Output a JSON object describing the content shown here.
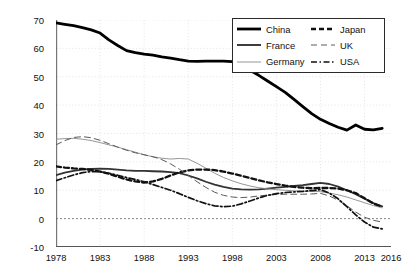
{
  "chart_data": {
    "type": "line",
    "title": "",
    "subtitle": "",
    "xlabel": "",
    "ylabel": "Value of net public wealth (% of national wealth)",
    "xlim": [
      1978,
      2016
    ],
    "ylim": [
      -10,
      70
    ],
    "yticks": [
      -10,
      0,
      10,
      20,
      30,
      40,
      50,
      60,
      70
    ],
    "xticks": [
      1978,
      1983,
      1988,
      1993,
      1998,
      2003,
      2008,
      2013,
      2016
    ],
    "xtick_labels": [
      "1978",
      "1983",
      "1988",
      "1993",
      "1998",
      "2003",
      "2008",
      "2013",
      "2016"
    ],
    "ytick_labels": [
      "-10",
      "0",
      "10",
      "20",
      "30",
      "40",
      "50",
      "60",
      "70"
    ],
    "grid": true,
    "legend_position": "top-right",
    "zero_line": 0,
    "x": [
      1978,
      1979,
      1980,
      1981,
      1982,
      1983,
      1984,
      1985,
      1986,
      1987,
      1988,
      1989,
      1990,
      1991,
      1992,
      1993,
      1994,
      1995,
      1996,
      1997,
      1998,
      1999,
      2000,
      2001,
      2002,
      2003,
      2004,
      2005,
      2006,
      2007,
      2008,
      2009,
      2010,
      2011,
      2012,
      2013,
      2014,
      2015
    ],
    "series": [
      {
        "name": "China",
        "style": "solid",
        "width": 2.8,
        "color": "#000000",
        "values": [
          69,
          68.5,
          68,
          67.3,
          66.5,
          65.4,
          63,
          61,
          59.2,
          58.5,
          58,
          57.6,
          57,
          56.6,
          56,
          55.5,
          55.4,
          55.5,
          55.5,
          55.5,
          55.3,
          54,
          52.3,
          50.5,
          48.5,
          46.5,
          44.5,
          42,
          39.5,
          37,
          35,
          33.5,
          32.2,
          31.2,
          33,
          31.5,
          31.3,
          31.8
        ]
      },
      {
        "name": "France",
        "style": "solid",
        "width": 1.8,
        "color": "#333333",
        "values": [
          15.3,
          16.2,
          16.8,
          17.3,
          17.5,
          17.6,
          17.5,
          17.3,
          17,
          16.8,
          16.8,
          16.7,
          16.6,
          16.4,
          16,
          15.2,
          14.2,
          13,
          12,
          11.2,
          10.6,
          10.3,
          10.2,
          10.3,
          10.6,
          10.9,
          11.2,
          11.5,
          11.8,
          12.2,
          12.6,
          12.2,
          11.3,
          10,
          8.6,
          7,
          5.5,
          4.3
        ]
      },
      {
        "name": "Germany",
        "style": "solid",
        "width": 0.9,
        "color": "#8a8a8a",
        "values": [
          28,
          28.2,
          28.3,
          28,
          27.5,
          26.8,
          26,
          25.2,
          24.3,
          23.4,
          22.5,
          21.8,
          21.3,
          21,
          21.2,
          21,
          19.5,
          17.8,
          16,
          14.5,
          13.3,
          12.3,
          11.5,
          10.9,
          10.5,
          10.2,
          10,
          9.8,
          9.7,
          9.6,
          9.5,
          9,
          8.4,
          7.6,
          6.6,
          5.6,
          4.6,
          3.8
        ]
      },
      {
        "name": "Japan",
        "style": "dashed-thick",
        "width": 2.3,
        "color": "#111111",
        "values": [
          18.4,
          18,
          17.7,
          17.5,
          17.2,
          16.6,
          15.8,
          14.8,
          13.8,
          13.1,
          12.7,
          13.1,
          14,
          15.2,
          16.3,
          17,
          17.3,
          17.3,
          17.1,
          16.6,
          15.9,
          15.1,
          14.3,
          13.5,
          12.8,
          12.2,
          11.6,
          11.2,
          10.9,
          10.7,
          10.8,
          10.8,
          10.6,
          10,
          9,
          7.2,
          5.3,
          4.2
        ]
      },
      {
        "name": "UK",
        "style": "dashed-thin",
        "width": 1.0,
        "color": "#5a5a5a",
        "values": [
          26,
          27.5,
          28.6,
          28.9,
          28.5,
          27.6,
          26.4,
          25.2,
          24.1,
          23.2,
          22.5,
          21.8,
          20.8,
          19.3,
          17.4,
          15.2,
          13,
          11,
          9.3,
          8.2,
          7.6,
          7.4,
          7.6,
          8,
          8.3,
          8.5,
          8.6,
          8.6,
          8.6,
          8.7,
          8.9,
          8,
          6.5,
          4.5,
          2.3,
          0.5,
          -0.6,
          -1.2
        ]
      },
      {
        "name": "USA",
        "style": "dash-dot",
        "width": 1.7,
        "color": "#111111",
        "values": [
          13.4,
          14.4,
          15.4,
          16.2,
          16.6,
          16.5,
          16,
          15.3,
          14.5,
          13.8,
          13,
          12,
          11,
          10,
          8.8,
          7.5,
          6.3,
          5.3,
          4.5,
          4.2,
          4.4,
          5.2,
          6.2,
          7.3,
          8.2,
          8.8,
          9.2,
          9.4,
          9.6,
          9.9,
          10.2,
          9,
          7,
          4.2,
          1.3,
          -1.2,
          -3,
          -3.6
        ]
      }
    ]
  },
  "legend": {
    "entries": [
      {
        "label": "China",
        "style": "solid-thick"
      },
      {
        "label": "Japan",
        "style": "dashed-thick"
      },
      {
        "label": "France",
        "style": "solid-medium"
      },
      {
        "label": "UK",
        "style": "dashed-thin"
      },
      {
        "label": "Germany",
        "style": "solid-thin"
      },
      {
        "label": "USA",
        "style": "dash-dot"
      }
    ]
  },
  "axes": {
    "y_title": "Value of net public wealth (% of national wealth)"
  }
}
